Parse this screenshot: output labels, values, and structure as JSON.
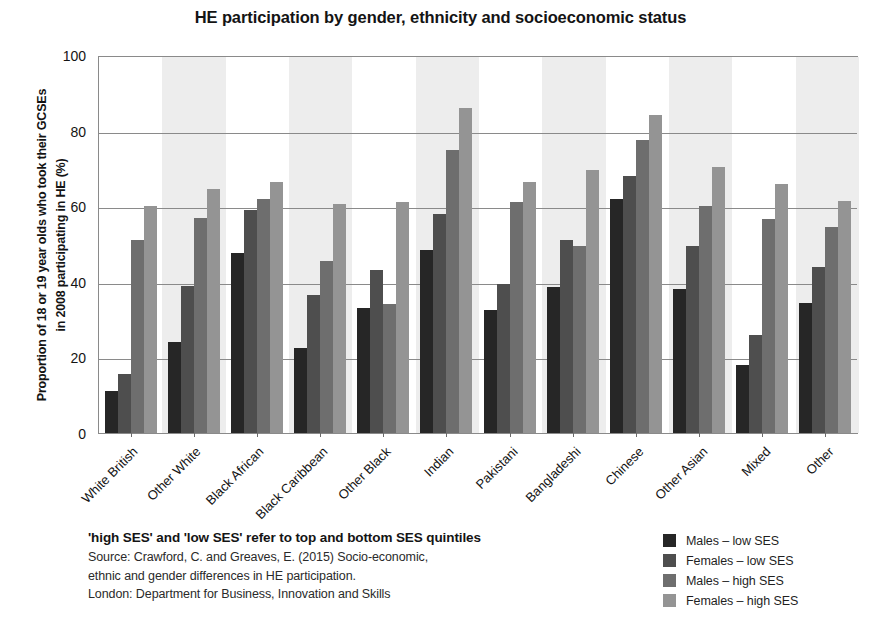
{
  "chart_data": {
    "type": "bar",
    "title": "HE participation by gender, ethnicity and socioeconomic status",
    "xlabel": "",
    "ylabel_line1": "Proportion of 18 or 19 year olds who took their GCSEs",
    "ylabel_line2": "in 2008 participating in HE (%)",
    "ylim": [
      0,
      100
    ],
    "yticks": [
      0,
      20,
      40,
      60,
      80,
      100
    ],
    "grid": true,
    "legend_position": "bottom-right",
    "categories": [
      "White British",
      "Other White",
      "Black African",
      "Black Caribbean",
      "Other Black",
      "Indian",
      "Pakistani",
      "Bangladeshi",
      "Chinese",
      "Other Asian",
      "Mixed",
      "Other"
    ],
    "series": [
      {
        "name": "Males – low SES",
        "color": "#262626",
        "values": [
          11,
          24,
          47.5,
          22.5,
          33,
          48.5,
          32.5,
          38.5,
          62,
          38,
          18,
          34.5
        ]
      },
      {
        "name": "Females – low SES",
        "color": "#4e4e4e",
        "values": [
          15.5,
          39,
          59,
          36.5,
          43,
          58,
          39.5,
          51,
          68,
          49.5,
          26,
          44
        ]
      },
      {
        "name": "Males – high SES",
        "color": "#6e6e6e",
        "values": [
          51,
          57,
          62,
          45.5,
          34,
          75,
          61,
          49.5,
          77.5,
          60,
          56.5,
          54.5
        ]
      },
      {
        "name": "Females – high SES",
        "color": "#949494",
        "values": [
          60,
          64.5,
          66.5,
          60.5,
          61,
          86,
          66.5,
          69.5,
          84,
          70.5,
          66,
          61.5
        ]
      }
    ]
  },
  "footnote": {
    "heading": "'high SES' and 'low SES' refer to top and bottom SES quintiles",
    "lines": [
      "Source: Crawford, C. and Greaves, E. (2015) Socio-economic,",
      "ethnic and gender differences in HE participation.",
      "London: Department for Business, Innovation and Skills"
    ]
  }
}
